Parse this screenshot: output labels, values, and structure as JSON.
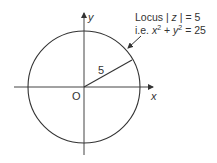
{
  "diagram": {
    "type": "argand-locus",
    "axes": {
      "x_label": "x",
      "y_label": "y",
      "origin_label": "O"
    },
    "circle": {
      "radius_label": "5",
      "radius_value": 5
    },
    "annotation": {
      "line1_prefix": "Locus | ",
      "line1_var": "z",
      "line1_suffix": " | = 5",
      "line2_prefix": "i.e. ",
      "line2_x": "x",
      "line2_plus": " + ",
      "line2_y": "y",
      "line2_exp": "2",
      "line2_suffix": " = 25"
    },
    "colors": {
      "stroke": "#333333",
      "background": "#ffffff"
    }
  }
}
